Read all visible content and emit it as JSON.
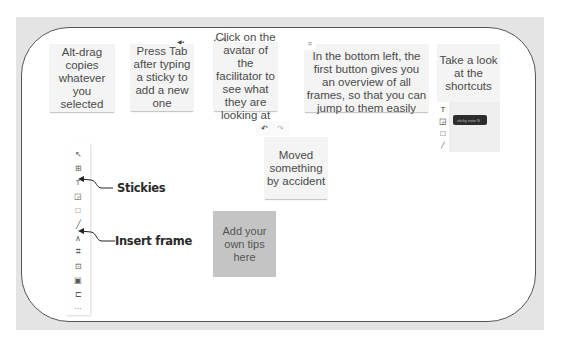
{
  "stickies": [
    {
      "id": "alt-drag",
      "text": "Alt-drag copies whatever you selected"
    },
    {
      "id": "press-tab",
      "text": "Press Tab after typing a sticky to add a new one"
    },
    {
      "id": "click-avatar",
      "text": "Click on the avatar of the facilitator to see what they are looking at"
    },
    {
      "id": "bottom-left",
      "text": "In the bottom left, the first button gives you an overview of all frames, so that you can jump to them easily"
    },
    {
      "id": "shortcuts",
      "text": "Take a look at the shortcuts"
    },
    {
      "id": "moved",
      "text": "Moved something by accident"
    },
    {
      "id": "add-tips",
      "text": "Add your own tips here"
    }
  ],
  "toolbar": {
    "tools": [
      {
        "name": "select-tool",
        "glyph": "↖"
      },
      {
        "name": "template-tool",
        "glyph": "⊞"
      },
      {
        "name": "text-tool",
        "glyph": "T"
      },
      {
        "name": "sticky-tool",
        "glyph": "◲"
      },
      {
        "name": "shape-tool",
        "glyph": "□"
      },
      {
        "name": "line-tool",
        "glyph": "╱"
      },
      {
        "name": "pen-tool",
        "glyph": "∧"
      },
      {
        "name": "frame-tool",
        "glyph": "⌗"
      },
      {
        "name": "upload-tool",
        "glyph": "⊡"
      },
      {
        "name": "embed-tool",
        "glyph": "▣"
      },
      {
        "name": "comment-tool",
        "glyph": "⊏"
      },
      {
        "name": "more-tool",
        "glyph": "···"
      }
    ]
  },
  "annotations": {
    "stickies": "Stickies",
    "insert_frame": "Insert frame"
  },
  "undo_redo": {
    "undo": "↶",
    "redo": "↷"
  },
  "shortcut_shot": {
    "tools": [
      "T",
      "◲",
      "□",
      "╱"
    ],
    "tooltip": "sticky note  N"
  },
  "cursor_tags": {
    "press_tab": "◀▪",
    "click_avatar": "✓ ⁄ ✎",
    "frames_icon": "⌗"
  }
}
